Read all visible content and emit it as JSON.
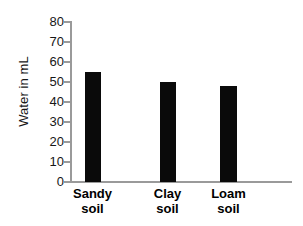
{
  "chart_data": {
    "type": "bar",
    "title": "",
    "xlabel": "",
    "ylabel": "Water in mL",
    "categories": [
      "Sandy soil",
      "Clay soil",
      "Loam soil"
    ],
    "category_lines": [
      [
        "Sandy",
        "soil"
      ],
      [
        "Clay",
        "soil"
      ],
      [
        "Loam",
        "soil"
      ]
    ],
    "values": [
      55,
      50,
      48
    ],
    "ylim": [
      0,
      80
    ],
    "ytick_step": 10,
    "yticks": [
      80,
      70,
      60,
      50,
      40,
      30,
      20,
      10,
      0
    ],
    "ytick_labels": [
      "80",
      "70",
      "60",
      "50",
      "40",
      "30",
      "20",
      "10",
      "0"
    ],
    "grid": false,
    "legend": false,
    "bar_color": "#0a0a0a",
    "axis_color": "#9a9a9a",
    "background_color": "#ffffff"
  },
  "axes": {
    "y_title": "Water in mL"
  }
}
